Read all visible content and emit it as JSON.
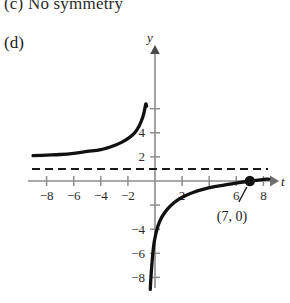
{
  "answers": {
    "part_c_text": "(c)  No symmetry",
    "part_d_label": "(d)"
  },
  "chart_data": {
    "type": "line",
    "title": "",
    "xlabel": "t",
    "ylabel": "y",
    "xlim": [
      -9.5,
      9.0
    ],
    "ylim": [
      -9.2,
      6.2
    ],
    "grid": false,
    "legend": null,
    "x_tick_labels": [
      "-8",
      "-6",
      "-4",
      "-2",
      "2",
      "6",
      "8"
    ],
    "x_tick_values": [
      -8,
      -6,
      -4,
      -2,
      2,
      6,
      8
    ],
    "x_unlabeled_ticks": [
      4
    ],
    "y_tick_labels": [
      "4",
      "2",
      "-4",
      "-6",
      "-8"
    ],
    "y_tick_values": [
      4,
      2,
      -4,
      -6,
      -8
    ],
    "y_unlabeled_ticks": [
      6,
      -2
    ],
    "asymptote": {
      "kind": "horizontal",
      "value": 1,
      "style": "dashed",
      "label": ""
    },
    "series": [
      {
        "name": "left-branch",
        "style": "solid",
        "x": [
          -9.0,
          -8.0,
          -7.0,
          -6.0,
          -5.0,
          -4.0,
          -3.0,
          -2.4,
          -1.9,
          -1.5,
          -1.2,
          -1.0,
          -0.85,
          -0.75,
          -0.68,
          -0.62
        ],
        "y": [
          2.1,
          2.15,
          2.2,
          2.3,
          2.45,
          2.6,
          2.95,
          3.25,
          3.6,
          4.0,
          4.5,
          5.0,
          5.5,
          6.0,
          6.4,
          6.2
        ]
      },
      {
        "name": "right-branch",
        "style": "solid",
        "x": [
          -0.35,
          -0.3,
          -0.2,
          -0.05,
          0.2,
          0.5,
          0.9,
          1.4,
          2.0,
          2.8,
          3.6,
          4.5,
          5.4,
          6.2,
          7.0,
          7.8,
          8.4
        ],
        "y": [
          -9.0,
          -8.0,
          -6.5,
          -5.0,
          -3.8,
          -3.0,
          -2.35,
          -1.8,
          -1.35,
          -0.95,
          -0.68,
          -0.45,
          -0.28,
          -0.13,
          0.0,
          0.1,
          0.16
        ]
      }
    ],
    "points": [
      {
        "name": "t-intercept",
        "x": 7,
        "y": 0,
        "marker": "filled-circle",
        "label": "(7, 0)",
        "leader_line": true
      }
    ]
  }
}
